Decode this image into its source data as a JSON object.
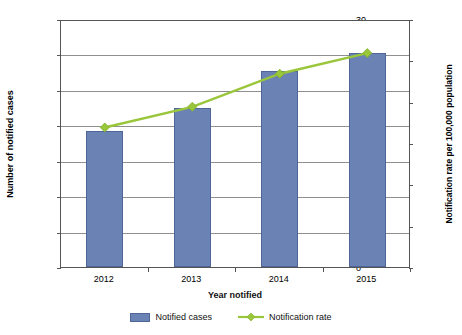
{
  "chart_data": {
    "type": "bar",
    "title": "",
    "subtitle": "",
    "xlabel": "Year notified",
    "ylabel": "Number of notified cases",
    "y2label": "Notification rate per 100,000 population",
    "categories": [
      "2012",
      "2013",
      "2014",
      "2015"
    ],
    "ylim": [
      0,
      1400
    ],
    "y2lim": [
      0,
      30
    ],
    "yticks": [
      0,
      200,
      400,
      600,
      800,
      1000,
      1200,
      1400
    ],
    "ytick_labels": [
      "0",
      "200",
      "400",
      "600",
      "800",
      "1000",
      "1200",
      "1400"
    ],
    "y2ticks": [
      0,
      5,
      10,
      15,
      20,
      25,
      30
    ],
    "y2tick_labels": [
      "0",
      "5",
      "10",
      "15",
      "20",
      "25",
      "30"
    ],
    "grid": true,
    "legend_position": "bottom",
    "series": [
      {
        "name": "Notified cases",
        "kind": "bar",
        "axis": "left",
        "color": "#6b82b5",
        "border_color": "#4e6698",
        "values": [
          770,
          900,
          1105,
          1210
        ]
      },
      {
        "name": "Notification rate",
        "kind": "line",
        "axis": "right",
        "color": "#9ac63b",
        "marker": "diamond",
        "values": [
          17.0,
          19.5,
          23.5,
          26.0
        ]
      }
    ]
  },
  "legend": {
    "items": [
      {
        "label": "Notified cases",
        "icon": "bar-swatch"
      },
      {
        "label": "Notification rate",
        "icon": "line-diamond-swatch"
      }
    ]
  }
}
